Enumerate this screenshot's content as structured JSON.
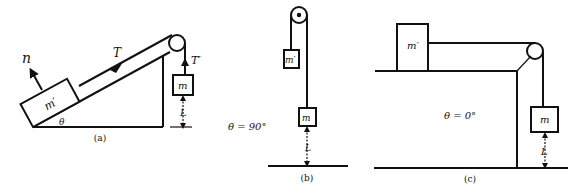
{
  "panels": [
    {
      "id": "a",
      "caption": "(a)",
      "angle_label": "θ",
      "block_upper_label": "m′",
      "block_hanging_label": "m",
      "normal_force_label": "n",
      "tension_label": "T",
      "tension_hanging_label": "T′",
      "height_label": "L"
    },
    {
      "id": "b",
      "caption": "(b)",
      "angle_label": "θ = 90°",
      "block_upper_label": "m′",
      "block_hanging_label": "m",
      "height_label": "L"
    },
    {
      "id": "c",
      "caption": "(c)",
      "angle_label": "θ = 0°",
      "block_upper_label": "m′",
      "block_hanging_label": "m",
      "height_label": "L"
    }
  ]
}
